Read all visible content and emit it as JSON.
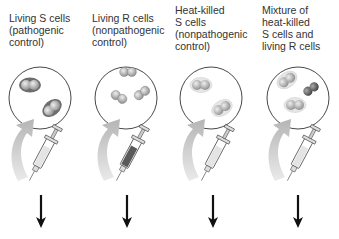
{
  "panels": [
    {
      "label": "Living S cells\n(pathogenic\ncontrol)",
      "cells": "S",
      "syringe": "light"
    },
    {
      "label": "Living R cells\n(nonpathogenic\ncontrol)",
      "cells": "R",
      "syringe": "dark"
    },
    {
      "label": "Heat-killed\nS cells\n(nonpathogenic\ncontrol)",
      "cells": "S-killed",
      "syringe": "light"
    },
    {
      "label": "Mixture of\nheat-killed\nS cells and\nliving R cells",
      "cells": "mixture",
      "syringe": "light"
    }
  ],
  "icons": {
    "petri": "petri-dish-icon",
    "syringe": "syringe-icon",
    "curved_arrow": "curved-arrow-icon",
    "down_arrow": "down-arrow-icon"
  },
  "colors": {
    "outline": "#333333",
    "s_capsule": "#6e6e6e",
    "cell": "#b8b8b8",
    "killed_capsule": "#e2e2e2",
    "curved_arrow": "#c8c8c8",
    "arrow": "#111111"
  }
}
